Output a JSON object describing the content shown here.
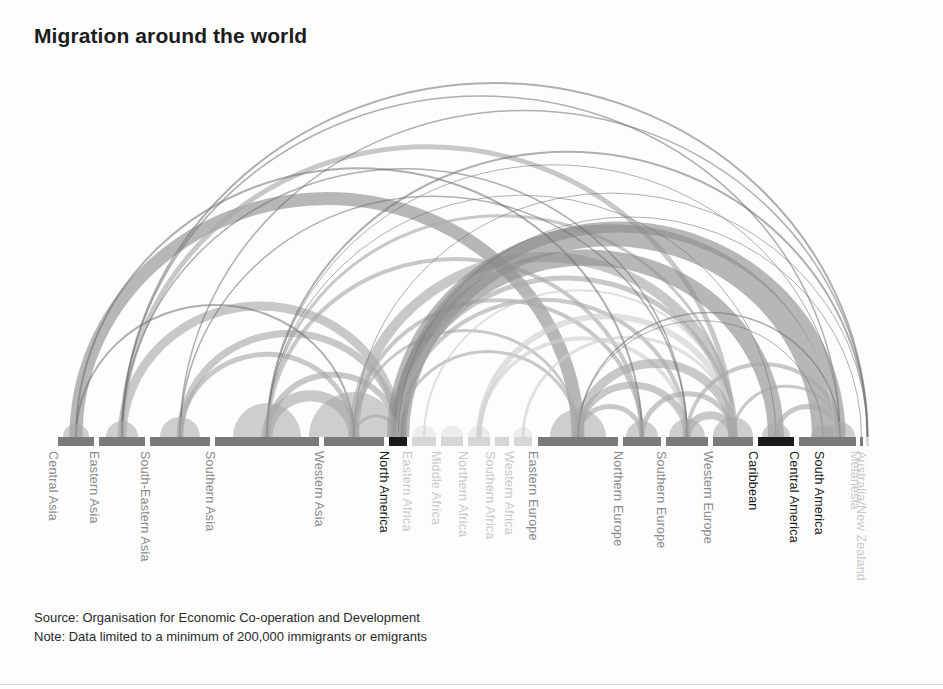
{
  "title": "Migration around the world",
  "footer": {
    "source": "Source: Organisation for Economic Co-operation and Development",
    "note": "Note: Data limited to a minimum of 200,000 immigrants or emigrants"
  },
  "colors": {
    "background": "#fdfdfd",
    "title": "#1c1c1c",
    "arc_strong": "#8d8d8d",
    "arc_mid": "#a8a8a8",
    "arc_faint": "#cfcfcf",
    "arc_hairline": "#6f6f6f",
    "node_dark": "#1a1a1a",
    "node_mid": "#7a7a7a",
    "node_light": "#d6d6d6",
    "label_dark": "#1a1a1a",
    "label_mid": "#8a8a8a",
    "label_light": "#c9c9c9",
    "footer_text": "#2a2a2a",
    "rule": "#d8d8d8"
  },
  "chart_data": {
    "type": "arc-diagram",
    "title": "Migration around the world",
    "xlabel": "",
    "ylabel": "",
    "grid": false,
    "legend": "none",
    "baseline_y": 437,
    "axis_x_range": [
      58,
      866
    ],
    "nodes": [
      {
        "id": "central-asia",
        "label": "Central Asia",
        "x": 58,
        "width": 36,
        "tone": "mid",
        "label_tone": "mid"
      },
      {
        "id": "eastern-asia",
        "label": "Eastern Asia",
        "x": 99,
        "width": 46,
        "tone": "mid",
        "label_tone": "mid"
      },
      {
        "id": "south-eastern-asia",
        "label": "South-Eastern Asia",
        "x": 150,
        "width": 60,
        "tone": "mid",
        "label_tone": "mid"
      },
      {
        "id": "southern-asia",
        "label": "Southern Asia",
        "x": 215,
        "width": 104,
        "tone": "mid",
        "label_tone": "mid"
      },
      {
        "id": "western-asia",
        "label": "Western Asia",
        "x": 324,
        "width": 60,
        "tone": "mid",
        "label_tone": "mid"
      },
      {
        "id": "north-america",
        "label": "North America",
        "x": 389,
        "width": 18,
        "tone": "dark",
        "label_tone": "dark"
      },
      {
        "id": "eastern-africa",
        "label": "Eastern Africa",
        "x": 412,
        "width": 24,
        "tone": "light",
        "label_tone": "light"
      },
      {
        "id": "middle-africa",
        "label": "Middle Africa",
        "x": 441,
        "width": 22,
        "tone": "light",
        "label_tone": "light"
      },
      {
        "id": "northern-africa",
        "label": "Northern Africa",
        "x": 468,
        "width": 22,
        "tone": "light",
        "label_tone": "light"
      },
      {
        "id": "southern-africa",
        "label": "Southern Africa",
        "x": 495,
        "width": 14,
        "tone": "light",
        "label_tone": "light"
      },
      {
        "id": "western-africa",
        "label": "Western Africa",
        "x": 514,
        "width": 18,
        "tone": "light",
        "label_tone": "light"
      },
      {
        "id": "eastern-europe",
        "label": "Eastern Europe",
        "x": 538,
        "width": 80,
        "tone": "mid",
        "label_tone": "mid"
      },
      {
        "id": "northern-europe",
        "label": "Northern Europe",
        "x": 623,
        "width": 38,
        "tone": "mid",
        "label_tone": "mid"
      },
      {
        "id": "southern-europe",
        "label": "Southern Europe",
        "x": 666,
        "width": 42,
        "tone": "mid",
        "label_tone": "mid"
      },
      {
        "id": "western-europe",
        "label": "Western Europe",
        "x": 713,
        "width": 40,
        "tone": "mid",
        "label_tone": "mid"
      },
      {
        "id": "caribbean",
        "label": "Caribbean",
        "x": 758,
        "width": 36,
        "tone": "dark",
        "label_tone": "dark"
      },
      {
        "id": "central-america",
        "label": "Central America",
        "x": 799,
        "width": 48,
        "tone": "mid",
        "label_tone": "dark"
      },
      {
        "id": "south-america",
        "label": "South America",
        "x": 824,
        "width": 32,
        "tone": "mid",
        "label_tone": "dark"
      },
      {
        "id": "melanesia",
        "label": "Melanesia",
        "x": 860,
        "width": 3,
        "tone": "mid",
        "label_tone": "light"
      },
      {
        "id": "australia-nz",
        "label": "Australia/New Zealand",
        "x": 866,
        "width": 3,
        "tone": "light",
        "label_tone": "light"
      }
    ],
    "self_loops": [
      {
        "node": "central-asia",
        "radius": 13,
        "tone": "arc_mid"
      },
      {
        "node": "eastern-asia",
        "radius": 16,
        "tone": "arc_mid"
      },
      {
        "node": "south-eastern-asia",
        "radius": 20,
        "tone": "arc_mid"
      },
      {
        "node": "southern-asia",
        "radius": 34,
        "tone": "arc_mid"
      },
      {
        "node": "western-asia",
        "radius": 45,
        "tone": "arc_mid"
      },
      {
        "node": "eastern-africa",
        "radius": 12,
        "tone": "arc_faint"
      },
      {
        "node": "middle-africa",
        "radius": 11,
        "tone": "arc_faint"
      },
      {
        "node": "northern-africa",
        "radius": 11,
        "tone": "arc_faint"
      },
      {
        "node": "western-africa",
        "radius": 10,
        "tone": "arc_faint"
      },
      {
        "node": "eastern-europe",
        "radius": 28,
        "tone": "arc_mid"
      },
      {
        "node": "northern-europe",
        "radius": 16,
        "tone": "arc_mid"
      },
      {
        "node": "southern-europe",
        "radius": 18,
        "tone": "arc_mid"
      },
      {
        "node": "western-europe",
        "radius": 20,
        "tone": "arc_mid"
      },
      {
        "node": "caribbean",
        "radius": 14,
        "tone": "arc_mid"
      },
      {
        "node": "central-america",
        "radius": 12,
        "tone": "arc_mid"
      },
      {
        "node": "south-america",
        "radius": 15,
        "tone": "arc_mid"
      }
    ],
    "flows": [
      {
        "from": "central-asia",
        "to": "eastern-europe",
        "weight": 13,
        "tone": "arc_strong"
      },
      {
        "from": "eastern-asia",
        "to": "north-america",
        "weight": 9,
        "tone": "arc_mid"
      },
      {
        "from": "eastern-asia",
        "to": "western-europe",
        "weight": 5,
        "tone": "arc_mid"
      },
      {
        "from": "eastern-asia",
        "to": "australia-nz",
        "weight": 2,
        "tone": "arc_hairline"
      },
      {
        "from": "eastern-asia",
        "to": "south-america",
        "weight": 1.5,
        "tone": "arc_hairline"
      },
      {
        "from": "south-eastern-asia",
        "to": "north-america",
        "weight": 7,
        "tone": "arc_mid"
      },
      {
        "from": "south-eastern-asia",
        "to": "western-asia",
        "weight": 5,
        "tone": "arc_mid"
      },
      {
        "from": "south-eastern-asia",
        "to": "australia-nz",
        "weight": 1.5,
        "tone": "arc_hairline"
      },
      {
        "from": "southern-asia",
        "to": "western-asia",
        "weight": 11,
        "tone": "arc_mid"
      },
      {
        "from": "southern-asia",
        "to": "north-america",
        "weight": 6,
        "tone": "arc_mid"
      },
      {
        "from": "southern-asia",
        "to": "northern-europe",
        "weight": 4,
        "tone": "arc_mid"
      },
      {
        "from": "southern-asia",
        "to": "western-europe",
        "weight": 3,
        "tone": "arc_mid"
      },
      {
        "from": "southern-asia",
        "to": "australia-nz",
        "weight": 2,
        "tone": "arc_hairline"
      },
      {
        "from": "western-asia",
        "to": "western-europe",
        "weight": 10,
        "tone": "arc_mid"
      },
      {
        "from": "western-asia",
        "to": "northern-europe",
        "weight": 4,
        "tone": "arc_mid"
      },
      {
        "from": "western-asia",
        "to": "north-america",
        "weight": 3,
        "tone": "arc_mid"
      },
      {
        "from": "western-asia",
        "to": "eastern-europe",
        "weight": 3,
        "tone": "arc_mid"
      },
      {
        "from": "north-america",
        "to": "caribbean",
        "weight": 16,
        "tone": "arc_strong"
      },
      {
        "from": "north-america",
        "to": "central-america",
        "weight": 22,
        "tone": "arc_strong"
      },
      {
        "from": "north-america",
        "to": "south-america",
        "weight": 11,
        "tone": "arc_strong"
      },
      {
        "from": "north-america",
        "to": "western-europe",
        "weight": 5,
        "tone": "arc_mid"
      },
      {
        "from": "north-america",
        "to": "southern-europe",
        "weight": 4,
        "tone": "arc_mid"
      },
      {
        "from": "north-america",
        "to": "eastern-europe",
        "weight": 3,
        "tone": "arc_mid"
      },
      {
        "from": "eastern-africa",
        "to": "western-europe",
        "weight": 2,
        "tone": "arc_faint"
      },
      {
        "from": "northern-africa",
        "to": "western-europe",
        "weight": 6,
        "tone": "arc_faint"
      },
      {
        "from": "northern-africa",
        "to": "southern-europe",
        "weight": 4,
        "tone": "arc_faint"
      },
      {
        "from": "western-africa",
        "to": "western-europe",
        "weight": 3,
        "tone": "arc_faint"
      },
      {
        "from": "eastern-europe",
        "to": "western-europe",
        "weight": 9,
        "tone": "arc_mid"
      },
      {
        "from": "eastern-europe",
        "to": "southern-europe",
        "weight": 7,
        "tone": "arc_mid"
      },
      {
        "from": "eastern-europe",
        "to": "northern-europe",
        "weight": 5,
        "tone": "arc_mid"
      },
      {
        "from": "northern-europe",
        "to": "western-europe",
        "weight": 5,
        "tone": "arc_mid"
      },
      {
        "from": "southern-europe",
        "to": "western-europe",
        "weight": 8,
        "tone": "arc_mid"
      },
      {
        "from": "southern-europe",
        "to": "south-america",
        "weight": 4,
        "tone": "arc_mid"
      },
      {
        "from": "western-europe",
        "to": "south-america",
        "weight": 3,
        "tone": "arc_mid"
      },
      {
        "from": "caribbean",
        "to": "south-america",
        "weight": 5,
        "tone": "arc_mid"
      },
      {
        "from": "central-america",
        "to": "south-america",
        "weight": 4,
        "tone": "arc_mid"
      },
      {
        "from": "central-asia",
        "to": "northern-europe",
        "weight": 2,
        "tone": "arc_hairline"
      },
      {
        "from": "central-asia",
        "to": "western-asia",
        "weight": 2,
        "tone": "arc_hairline"
      },
      {
        "from": "southern-asia",
        "to": "south-america",
        "weight": 1,
        "tone": "arc_hairline"
      },
      {
        "from": "eastern-asia",
        "to": "southern-europe",
        "weight": 1.5,
        "tone": "arc_hairline"
      },
      {
        "from": "south-eastern-asia",
        "to": "southern-europe",
        "weight": 1.5,
        "tone": "arc_hairline"
      },
      {
        "from": "north-america",
        "to": "melanesia",
        "weight": 1,
        "tone": "arc_hairline"
      },
      {
        "from": "western-asia",
        "to": "australia-nz",
        "weight": 1,
        "tone": "arc_hairline"
      },
      {
        "from": "eastern-europe",
        "to": "south-america",
        "weight": 1.5,
        "tone": "arc_hairline"
      },
      {
        "from": "eastern-europe",
        "to": "central-america",
        "weight": 1,
        "tone": "arc_hairline"
      },
      {
        "from": "southern-asia",
        "to": "caribbean",
        "weight": 1,
        "tone": "arc_hairline"
      }
    ]
  }
}
